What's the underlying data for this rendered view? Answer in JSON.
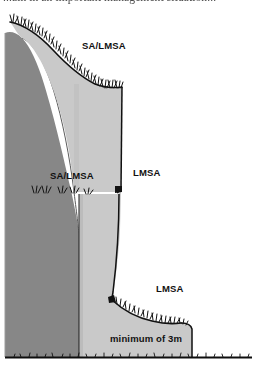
{
  "page": {
    "width": 256,
    "height": 375,
    "background": "#ffffff",
    "clipped_header_text": "...ain in an important management situation..."
  },
  "figure": {
    "name": "terraced-slope-cross-section",
    "colors": {
      "back_face": "#878787",
      "front_face": "#c9c9c9",
      "front_face_shadow": "#b9b9b9",
      "outline": "#111111",
      "ground_line": "#101010",
      "background": "#ffffff"
    }
  },
  "labels": {
    "sa_lmsa_top": "SA/LMSA",
    "sa_lmsa_mid": "SA/LMSA",
    "lmsa_mid": "LMSA",
    "lmsa_low": "LMSA",
    "minimum_depth": "minimum of 3m"
  }
}
